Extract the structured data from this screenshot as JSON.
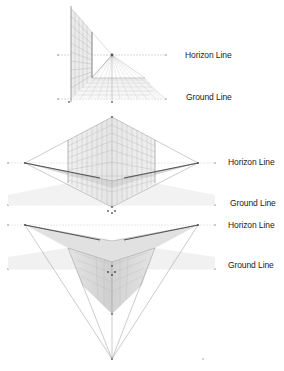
{
  "colors": {
    "line": "#9a9a9a",
    "grid": "#c4c4c4",
    "dark": "#555555",
    "label": "#222222",
    "background": "#ffffff"
  },
  "diagrams": [
    {
      "type": "one-point-perspective",
      "labels": {
        "horizon": "Horizon Line",
        "ground": "Ground Line"
      },
      "horizon_y": 55,
      "ground_y": 99,
      "vanishing_points": [
        [
          112,
          55
        ]
      ]
    },
    {
      "type": "two-point-perspective",
      "labels": {
        "horizon": "Horizon Line",
        "ground": "Ground Line"
      },
      "horizon_y": 163,
      "ground_y": 204,
      "vanishing_points": [
        [
          25,
          163
        ],
        [
          198,
          163
        ]
      ]
    },
    {
      "type": "three-point-perspective",
      "labels": {
        "horizon": "Horizon Line",
        "ground": "Ground Line"
      },
      "horizon_y": 225,
      "ground_y": 269,
      "vanishing_points": [
        [
          25,
          225
        ],
        [
          198,
          225
        ],
        [
          112,
          359
        ]
      ]
    }
  ]
}
